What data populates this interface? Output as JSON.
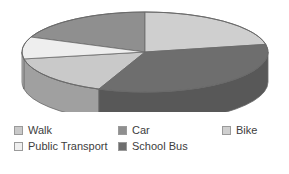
{
  "chart_data": {
    "type": "pie",
    "title": "",
    "subtitle": "",
    "xlabel": "",
    "ylabel": "",
    "three_d": true,
    "start_angle_deg": 0,
    "direction": "clockwise",
    "grid": false,
    "legend_position": "bottom",
    "categories": [
      "Walk",
      "Car",
      "Bike",
      "Public Transport",
      "School Bus"
    ],
    "values": [
      16,
      19,
      22,
      17,
      26
    ],
    "slices": [
      {
        "label": "Walk",
        "value": 16,
        "color": "#c9c9c9",
        "side_color": "#a0a0a0",
        "start_deg": 202,
        "end_deg": 260
      },
      {
        "label": "Car",
        "value": 19,
        "color": "#8f8f8f",
        "side_color": "#6f6f6f",
        "start_deg": 292,
        "end_deg": 360
      },
      {
        "label": "Bike",
        "value": 22,
        "color": "#cfcfcf",
        "side_color": "#a6a6a6",
        "start_deg": 0,
        "end_deg": 79
      },
      {
        "label": "Public Transport",
        "value": 17,
        "color": "#eeeeee",
        "side_color": "#bdbdbd",
        "start_deg": 260,
        "end_deg": 292
      },
      {
        "label": "School Bus",
        "value": 26,
        "color": "#6e6e6e",
        "side_color": "#585858",
        "start_deg": 79,
        "end_deg": 202
      }
    ]
  },
  "legend": {
    "rows": [
      [
        {
          "label": "Walk",
          "color": "#c9c9c9"
        },
        {
          "label": "Car",
          "color": "#8f8f8f"
        },
        {
          "label": "Bike",
          "color": "#cfcfcf"
        }
      ],
      [
        {
          "label": "Public Transport",
          "color": "#efefef"
        },
        {
          "label": "School Bus",
          "color": "#6e6e6e"
        }
      ]
    ]
  },
  "style": {
    "background": "#ffffff",
    "outline": "#6a6a6a",
    "text": "#3d3d3d"
  }
}
